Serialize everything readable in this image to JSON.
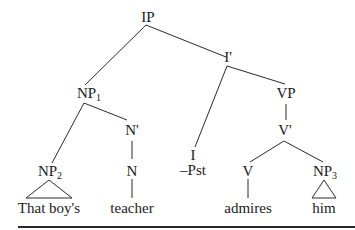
{
  "diagram": {
    "type": "syntax-tree",
    "nodes": {
      "ip": {
        "label": "IP"
      },
      "ibar": {
        "label": "I'"
      },
      "np1": {
        "label": "NP",
        "sub": "1"
      },
      "vp": {
        "label": "VP"
      },
      "nbar": {
        "label": "N'"
      },
      "vbar": {
        "label": "V'"
      },
      "i": {
        "label": "I",
        "feature": "–Pst"
      },
      "np2": {
        "label": "NP",
        "sub": "2"
      },
      "n": {
        "label": "N"
      },
      "v": {
        "label": "V"
      },
      "np3": {
        "label": "NP",
        "sub": "3"
      }
    },
    "leaves": {
      "np2": "That boy's",
      "n": "teacher",
      "v": "admires",
      "np3": "him"
    },
    "edges": [
      [
        "IP",
        "NP1"
      ],
      [
        "IP",
        "I'"
      ],
      [
        "NP1",
        "NP2"
      ],
      [
        "NP1",
        "N'"
      ],
      [
        "I'",
        "I"
      ],
      [
        "I'",
        "VP"
      ],
      [
        "N'",
        "N"
      ],
      [
        "VP",
        "V'"
      ],
      [
        "V'",
        "V"
      ],
      [
        "V'",
        "NP3"
      ],
      [
        "N",
        "teacher"
      ],
      [
        "V",
        "admires"
      ],
      [
        "NP2",
        "That boy's (triangle)"
      ],
      [
        "NP3",
        "him (triangle)"
      ]
    ],
    "colors": {
      "line": "#2a2a2a",
      "text": "#1a1a1a",
      "background": "#ffffff"
    }
  }
}
